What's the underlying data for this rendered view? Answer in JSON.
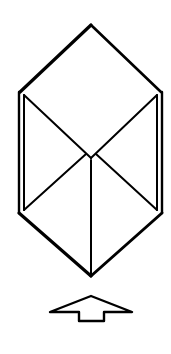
{
  "figure": {
    "stroke_color": "#000000",
    "background_color": "#ffffff",
    "shape": {
      "vertices": {
        "top": [
          91,
          25
        ],
        "upper_left": [
          20,
          92
        ],
        "upper_right": [
          161,
          92
        ],
        "center": [
          91,
          158
        ],
        "lower_left": [
          20,
          213
        ],
        "lower_right": [
          161,
          213
        ],
        "bottom": [
          91,
          276
        ]
      },
      "double_side_offset": 4
    },
    "arrow": {
      "direction": "up",
      "tip": [
        91,
        296
      ],
      "left_wing": [
        50,
        312
      ],
      "right_wing": [
        132,
        312
      ],
      "stem_left": 79,
      "stem_right": 104,
      "stem_bottom": 321
    }
  }
}
